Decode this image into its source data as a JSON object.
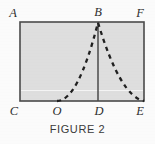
{
  "figure": {
    "caption": "FIGURE 2",
    "colors": {
      "fill": "#dedede",
      "stroke": "#4a4a4a",
      "dash": "#202020",
      "label": "#2e2e2e",
      "page": "#fbfbfb",
      "artifact": "#f2f2f2"
    },
    "rect": {
      "left": 20,
      "top": 22,
      "right": 144,
      "bottom": 101
    },
    "vertices": {
      "A": {
        "label": "A",
        "x": 20,
        "y": 22
      },
      "B": {
        "label": "B",
        "x": 98,
        "y": 22
      },
      "F": {
        "label": "F",
        "x": 144,
        "y": 22
      },
      "C": {
        "label": "C",
        "x": 20,
        "y": 101
      },
      "O": {
        "label": "O",
        "x": 57,
        "y": 101
      },
      "D": {
        "label": "D",
        "x": 98,
        "y": 101
      },
      "E": {
        "label": "E",
        "x": 144,
        "y": 101
      }
    },
    "labels": {
      "A": "A",
      "B": "B",
      "F": "F",
      "C": "C",
      "O": "O",
      "D": "D",
      "E": "E"
    },
    "segments": {
      "rectangle": "ACEF",
      "vertical": "BD"
    },
    "curve": {
      "style": "dashed",
      "description": "parabolic arc with vertex at B passing through O and E",
      "points": [
        [
          57,
          101
        ],
        [
          60,
          95
        ],
        [
          64,
          87
        ],
        [
          69,
          77
        ],
        [
          75,
          64
        ],
        [
          82,
          50
        ],
        [
          90,
          34
        ],
        [
          98,
          22
        ],
        [
          104,
          28
        ],
        [
          110,
          38
        ],
        [
          117,
          51
        ],
        [
          125,
          66
        ],
        [
          133,
          82
        ],
        [
          140,
          94
        ],
        [
          144,
          101
        ]
      ]
    }
  }
}
